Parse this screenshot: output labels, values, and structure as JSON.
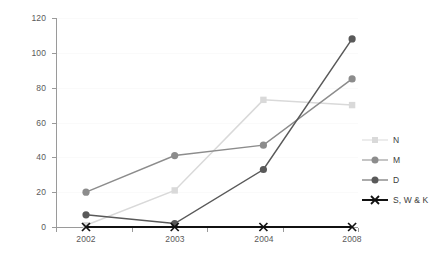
{
  "chart_data": {
    "type": "line",
    "title": "",
    "xlabel": "",
    "ylabel": "",
    "categories": [
      "2002",
      "2003",
      "2004",
      "2008"
    ],
    "ylim": [
      0,
      120
    ],
    "yticks": [
      0,
      20,
      40,
      60,
      80,
      100,
      120
    ],
    "grid": true,
    "legend_position": "right",
    "series": [
      {
        "name": "N",
        "values": [
          1,
          21,
          73,
          70
        ],
        "color": "#d9d9d9",
        "marker": "square"
      },
      {
        "name": "M",
        "values": [
          20,
          41,
          47,
          85
        ],
        "color": "#8c8c8c",
        "marker": "circle"
      },
      {
        "name": "D",
        "values": [
          7,
          2,
          33,
          108
        ],
        "color": "#595959",
        "marker": "circle"
      },
      {
        "name": "S, W & K",
        "values": [
          0,
          0,
          0,
          0
        ],
        "color": "#111111",
        "marker": "cross"
      }
    ]
  },
  "axes": {
    "y_tick_labels": [
      "0",
      "20",
      "40",
      "60",
      "80",
      "100",
      "120"
    ],
    "x_tick_labels": [
      "2002",
      "2003",
      "2004",
      "2008"
    ]
  },
  "legend": {
    "entries": [
      {
        "label": "N"
      },
      {
        "label": "M"
      },
      {
        "label": "D"
      },
      {
        "label": "S, W & K"
      }
    ]
  },
  "colors": {
    "axis": "#9a9a9a",
    "grid": "#fafafa",
    "text": "#4a4a4a",
    "background": "#ffffff"
  }
}
